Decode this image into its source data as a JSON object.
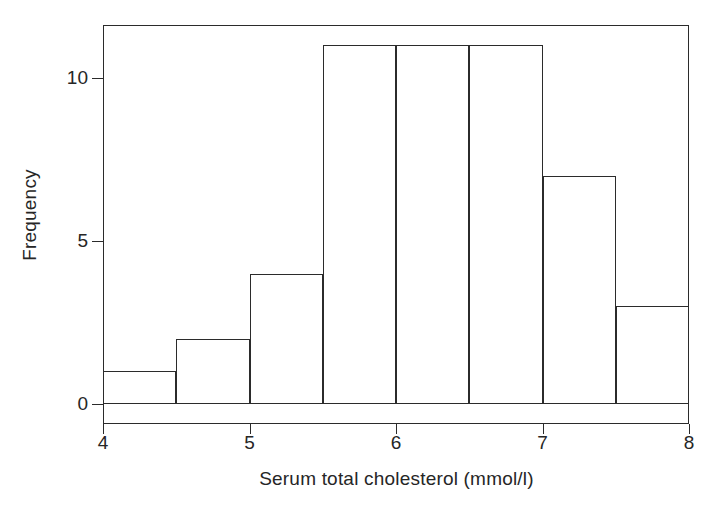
{
  "chart_data": {
    "type": "bar",
    "chart_subtype": "histogram",
    "title": "",
    "xlabel": "Serum total cholesterol (mmol/l)",
    "ylabel": "Frequency",
    "bin_width": 0.5,
    "bin_edges": [
      4.0,
      4.5,
      5.0,
      5.5,
      6.0,
      6.5,
      7.0,
      7.5,
      8.0
    ],
    "categories": [
      "4.0-4.5",
      "4.5-5.0",
      "5.0-5.5",
      "5.5-6.0",
      "6.0-6.5",
      "6.5-7.0",
      "7.0-7.5",
      "7.5-8.0"
    ],
    "values": [
      1,
      2,
      4,
      11,
      11,
      11,
      7,
      3
    ],
    "total_count": 50,
    "xlim": [
      4,
      8
    ],
    "ylim": [
      0,
      11.6
    ],
    "x_ticks": [
      4,
      5,
      6,
      7,
      8
    ],
    "x_tick_labels": [
      "4",
      "5",
      "6",
      "7",
      "8"
    ],
    "y_ticks": [
      0,
      5,
      10
    ],
    "y_tick_labels": [
      "0",
      "5",
      "10"
    ],
    "grid": false,
    "legend": false,
    "legend_position": "none",
    "bar_fill_color": "#ffffff",
    "bar_edge_color": "#2b2b2b",
    "frame_color": "#2b2b2b",
    "background_color": "#ffffff",
    "text_color": "#262626"
  }
}
